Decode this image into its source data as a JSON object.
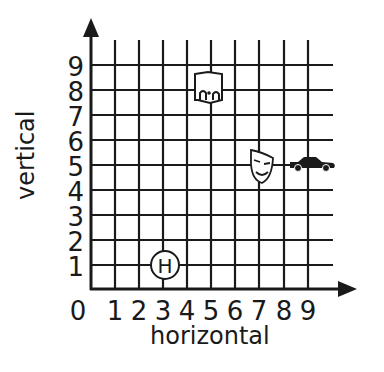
{
  "x_axis": {
    "title": "horizontal",
    "ticks": [
      "0",
      "1",
      "2",
      "3",
      "4",
      "5",
      "6",
      "7",
      "8",
      "9"
    ]
  },
  "y_axis": {
    "title": "vertical",
    "ticks": [
      "1",
      "2",
      "3",
      "4",
      "5",
      "6",
      "7",
      "8",
      "9"
    ]
  },
  "grid": {
    "columns": 10,
    "rows": 9,
    "line_color": "#1a1a1a"
  },
  "markers": [
    {
      "name": "hospital",
      "icon": "hospital-h-icon",
      "label": "H",
      "x": 3,
      "y": 1
    },
    {
      "name": "library",
      "icon": "library-building-icon",
      "x": 4.5,
      "y": 8.2
    },
    {
      "name": "theater",
      "icon": "theater-mask-icon",
      "x": 7,
      "y": 5
    },
    {
      "name": "car",
      "icon": "car-icon",
      "x": 8.8,
      "y": 5
    }
  ]
}
